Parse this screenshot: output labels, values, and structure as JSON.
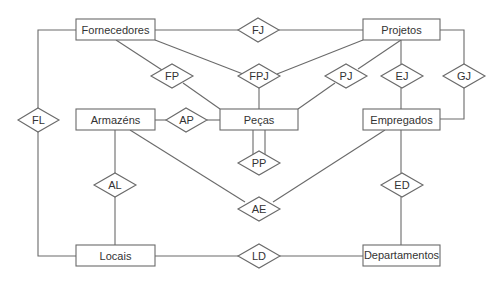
{
  "diagram": {
    "type": "entity-relationship",
    "entities": [
      {
        "id": "fornecedores",
        "label": "Fornecedores"
      },
      {
        "id": "projetos",
        "label": "Projetos"
      },
      {
        "id": "armazens",
        "label": "Armazéns"
      },
      {
        "id": "pecas",
        "label": "Peças"
      },
      {
        "id": "empregados",
        "label": "Empregados"
      },
      {
        "id": "locais",
        "label": "Locais"
      },
      {
        "id": "departamentos",
        "label": "Departamentos"
      }
    ],
    "relationships": [
      {
        "id": "fj",
        "label": "FJ",
        "connects": [
          "fornecedores",
          "projetos"
        ]
      },
      {
        "id": "fp",
        "label": "FP",
        "connects": [
          "fornecedores",
          "pecas"
        ]
      },
      {
        "id": "fpj",
        "label": "FPJ",
        "connects": [
          "fornecedores",
          "pecas",
          "projetos"
        ]
      },
      {
        "id": "pj",
        "label": "PJ",
        "connects": [
          "pecas",
          "projetos"
        ]
      },
      {
        "id": "ej",
        "label": "EJ",
        "connects": [
          "projetos",
          "empregados"
        ]
      },
      {
        "id": "gj",
        "label": "GJ",
        "connects": [
          "projetos",
          "empregados"
        ]
      },
      {
        "id": "fl",
        "label": "FL",
        "connects": [
          "fornecedores",
          "locais"
        ]
      },
      {
        "id": "ap",
        "label": "AP",
        "connects": [
          "armazens",
          "pecas"
        ]
      },
      {
        "id": "pp",
        "label": "PP",
        "connects": [
          "pecas",
          "pecas"
        ]
      },
      {
        "id": "al",
        "label": "AL",
        "connects": [
          "armazens",
          "locais"
        ]
      },
      {
        "id": "ae",
        "label": "AE",
        "connects": [
          "armazens",
          "empregados"
        ]
      },
      {
        "id": "ed",
        "label": "ED",
        "connects": [
          "empregados",
          "departamentos"
        ]
      },
      {
        "id": "ld",
        "label": "LD",
        "connects": [
          "locais",
          "departamentos"
        ]
      }
    ]
  }
}
